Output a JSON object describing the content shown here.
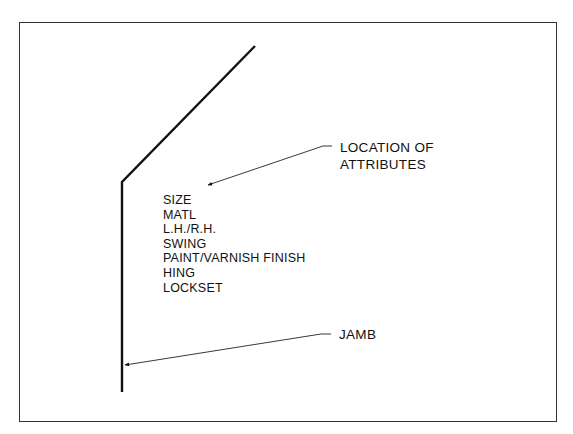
{
  "diagram": {
    "type": "door-symbol-annotation",
    "callouts": {
      "location_of_attributes": {
        "line1": "LOCATION OF",
        "line2": "ATTRIBUTES"
      },
      "jamb": {
        "label": "JAMB"
      }
    },
    "attributes": [
      "SIZE",
      "MATL",
      "L.H./R.H.",
      "SWING",
      "PAINT/VARNISH FINISH",
      "HING",
      "LOCKSET"
    ],
    "colors": {
      "line": "#111111",
      "frame": "#333333",
      "background": "#ffffff"
    }
  }
}
